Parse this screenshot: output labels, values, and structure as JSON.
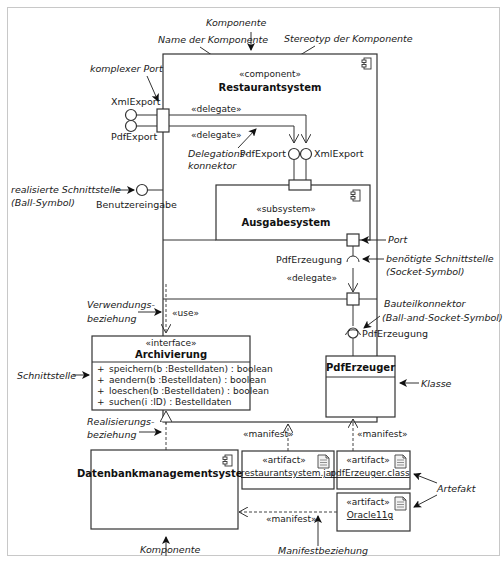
{
  "diagram": {
    "type": "UML component diagram",
    "annotations": {
      "komponente_top": "Komponente",
      "name_der_komponente": "Name der Komponente",
      "stereotyp_der_komponente": "Stereotyp der Komponente",
      "komplexer_port": "komplexer Port",
      "delegationskonnektor_1": "Delegations-",
      "delegationskonnektor_2": "konnektor",
      "realisierte_schnittstelle_1": "realisierte Schnittstelle",
      "realisierte_schnittstelle_2": "(Ball-Symbol)",
      "port": "Port",
      "benoetigte_schnittstelle_1": "benötigte Schnittstelle",
      "benoetigte_schnittstelle_2": "(Socket-Symbol)",
      "bauteilkonnektor_1": "Bauteilkonnektor",
      "bauteilkonnektor_2": "(Ball-and-Socket-Symbol)",
      "verwendungsbeziehung_1": "Verwendungs-",
      "verwendungsbeziehung_2": "beziehung",
      "schnittstelle": "Schnittstelle",
      "klasse": "Klasse",
      "realisierungsbeziehung_1": "Realisierungs-",
      "realisierungsbeziehung_2": "beziehung",
      "artefakt": "Artefakt",
      "manifestbeziehung": "Manifestbeziehung",
      "komponente_bottom": "Komponente"
    },
    "restaurantsystem": {
      "stereotype": "«component»",
      "name": "Restaurantsystem"
    },
    "ports": {
      "xml_export_left": "XmlExport",
      "pdf_export_left": "PdfExport",
      "pdf_export_inner": "PdfExport",
      "xml_export_inner": "XmlExport",
      "benutzereingabe": "Benutzereingabe",
      "pdf_erzeugung_socket": "PdfErzeugung",
      "pdf_erzeugung_ball": "PdfErzeugung"
    },
    "connectors": {
      "delegate_1": "«delegate»",
      "delegate_2": "«delegate»",
      "delegate_3": "«delegate»",
      "use": "«use»",
      "manifest_1": "«manifest»",
      "manifest_2": "«manifest»",
      "manifest_3": "«manifest»"
    },
    "ausgabesystem": {
      "stereotype": "«subsystem»",
      "name": "Ausgabesystem"
    },
    "archivierung": {
      "stereotype": "«interface»",
      "name": "Archivierung",
      "operations": [
        {
          "visibility": "+",
          "signature": "speichern(b :Bestelldaten) : boolean"
        },
        {
          "visibility": "+",
          "signature": "aendern(b :Bestelldaten) : boolean"
        },
        {
          "visibility": "+",
          "signature": "loeschen(b :Bestelldaten) : boolean"
        },
        {
          "visibility": "+",
          "signature": "suchen(i :ID) : Bestelldaten"
        }
      ]
    },
    "pdferzeuger": {
      "name": "PdfErzeuger"
    },
    "datenbank": {
      "name": "Datenbankmanagementsystem"
    },
    "artifacts": [
      {
        "stereotype": "«artifact»",
        "name": "restaurantsystem.jar"
      },
      {
        "stereotype": "«artifact»",
        "name": "pdfErzeuger.class"
      },
      {
        "stereotype": "«artifact»",
        "name": "Oracle11g"
      }
    ],
    "icons": {
      "component_icon": "component-icon",
      "artifact_icon": "document-icon"
    }
  }
}
